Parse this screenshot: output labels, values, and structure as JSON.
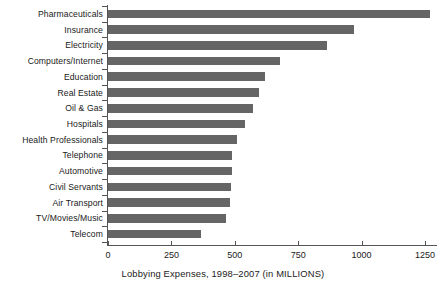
{
  "chart_data": {
    "type": "bar",
    "orientation": "horizontal",
    "title": "",
    "xlabel": "Lobbying Expenses, 1998–2007 (in MILLIONS)",
    "ylabel": "",
    "xlim": [
      0,
      1250
    ],
    "grid": false,
    "legend": null,
    "bar_color": "#656565",
    "axis_color": "#555555",
    "background": "#ffffff",
    "xticks": [
      0,
      250,
      500,
      750,
      1000,
      1250
    ],
    "xtick_labels": [
      "0",
      "250",
      "500",
      "750",
      "1000",
      "1250"
    ],
    "categories": [
      "Pharmaceuticals",
      "Insurance",
      "Electricity",
      "Computers/Internet",
      "Education",
      "Real Estate",
      "Oil & Gas",
      "Hospitals",
      "Health Professionals",
      "Telephone",
      "Automotive",
      "Civil Servants",
      "Air Transport",
      "TV/Movies/Music",
      "Telecom"
    ],
    "values": [
      1270,
      970,
      865,
      680,
      620,
      595,
      570,
      540,
      510,
      490,
      490,
      485,
      480,
      465,
      365
    ]
  },
  "axis": {
    "x_title": "Lobbying Expenses, 1998–2007 (in MILLIONS)"
  },
  "ticks": {
    "t0": "0",
    "t1": "250",
    "t2": "500",
    "t3": "750",
    "t4": "1000",
    "t5": "1250"
  },
  "labels": {
    "c0": "Pharmaceuticals",
    "c1": "Insurance",
    "c2": "Electricity",
    "c3": "Computers/Internet",
    "c4": "Education",
    "c5": "Real Estate",
    "c6": "Oil & Gas",
    "c7": "Hospitals",
    "c8": "Health Professionals",
    "c9": "Telephone",
    "c10": "Automotive",
    "c11": "Civil Servants",
    "c12": "Air Transport",
    "c13": "TV/Movies/Music",
    "c14": "Telecom"
  }
}
